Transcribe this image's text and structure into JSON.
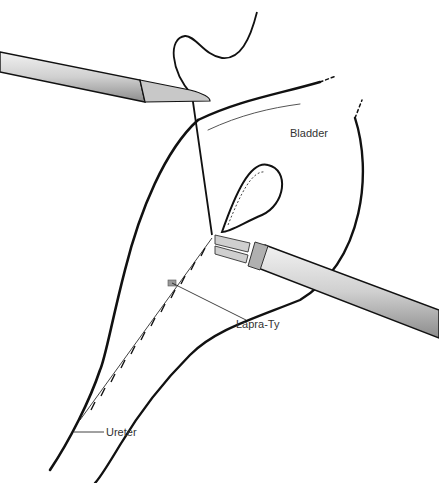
{
  "figure": {
    "labels": {
      "bladder": "Bladder",
      "lapra_ty": "Lapra-Ty",
      "ureter": "Ureter"
    },
    "colors": {
      "ink": "#111111",
      "instrument_fill": "#d6d6d6",
      "instrument_shade": "#a8a8a8",
      "label_text": "#333333"
    }
  }
}
